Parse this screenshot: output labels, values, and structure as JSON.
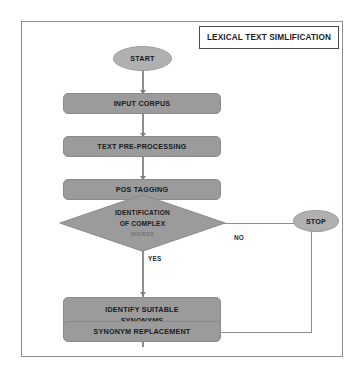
{
  "figure": {
    "title": "LEXICAL TEXT SIMLIFICATION",
    "type": "flowchart",
    "colors": {
      "process_fill": "#9b9b9b",
      "terminal_fill": "#b0b0b0",
      "connector": "#8e8e8e",
      "frame_border": "#8c8c8c",
      "title_border": "#4a4a4a",
      "text": "#1a1a1a",
      "background": "#ffffff"
    }
  },
  "nodes": {
    "start": {
      "label": "START",
      "shape": "ellipse"
    },
    "input_corpus": {
      "label": "INPUT CORPUS",
      "shape": "rounded-rect"
    },
    "text_preprocessing": {
      "label": "TEXT PRE-PROCESSING",
      "shape": "rounded-rect"
    },
    "pos_tagging": {
      "label": "POS TAGGING",
      "shape": "rounded-rect"
    },
    "identification": {
      "line1": "IDENTIFICATION",
      "line2": "OF COMPLEX",
      "line3": "WORDS",
      "shape": "diamond"
    },
    "identify_synonyms": {
      "line1": "IDENTIFY SUITABLE",
      "line2": "SYNONYMS",
      "shape": "rounded-rect"
    },
    "synonym_replacement": {
      "label": "SYNONYM REPLACEMENT",
      "shape": "rounded-rect"
    },
    "stop": {
      "label": "STOP",
      "shape": "ellipse"
    }
  },
  "edges": {
    "yes_label": "YES",
    "no_label": "NO"
  }
}
